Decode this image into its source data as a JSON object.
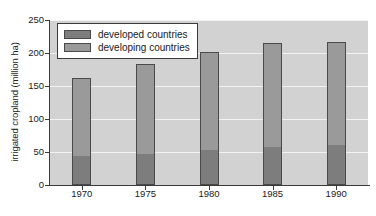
{
  "chart_data": {
    "type": "bar",
    "subtype": "stacked",
    "title": "",
    "xlabel": "",
    "ylabel": "irrigated cropland (million ha)",
    "categories": [
      "1970",
      "1975",
      "1980",
      "1985",
      "1990"
    ],
    "ylim": [
      0,
      250
    ],
    "yticks": [
      0,
      50,
      100,
      150,
      200,
      250
    ],
    "ytick_labels": [
      "0",
      "50",
      "100",
      "150",
      "200",
      "250"
    ],
    "grid": true,
    "grid_axis": "y",
    "legend_position": "top-left",
    "series": [
      {
        "name": "developed countries",
        "color": "#7d7d7d",
        "values": [
          42,
          45,
          51,
          56,
          59
        ]
      },
      {
        "name": "developing countries",
        "color": "#9a9a9a",
        "values": [
          120,
          138,
          151,
          159,
          158
        ]
      }
    ],
    "totals": [
      162,
      183,
      202,
      215,
      217
    ]
  },
  "legend": {
    "items": [
      {
        "label": "developed countries",
        "swatch": "#7d7d7d"
      },
      {
        "label": "developing countries",
        "swatch": "#9a9a9a"
      }
    ]
  },
  "colors": {
    "plot_background": "#d2d2d2",
    "gridline": "#f2f2f2",
    "axis": "#3a3a3a",
    "bar_outline": "#4a4a4a",
    "page_background": "#ffffff",
    "text": "#1a1a1a"
  }
}
